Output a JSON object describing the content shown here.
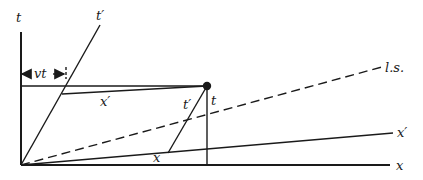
{
  "diagram": {
    "labels": {
      "t_axis": "t",
      "t_prime_axis": "t′",
      "x_axis": "x",
      "x_prime_axis": "x′",
      "light_signal": "l.s.",
      "vt": "vt",
      "x_prime_segment": "x′",
      "t_prime_segment": "t′",
      "t_segment": "t",
      "x_segment": "x"
    },
    "colors": {
      "ink": "#1a1a1a",
      "background": "#ffffff"
    }
  }
}
